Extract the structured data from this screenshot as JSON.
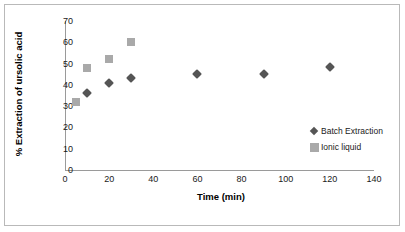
{
  "chart_data": {
    "type": "scatter",
    "title": "",
    "xlabel": "Time (min)",
    "ylabel": "% Extraction of ursolic acid",
    "xlim": [
      0,
      140
    ],
    "ylim": [
      0,
      70
    ],
    "xticks": [
      0,
      20,
      40,
      60,
      80,
      100,
      120,
      140
    ],
    "yticks": [
      0,
      10,
      20,
      30,
      40,
      50,
      60,
      70
    ],
    "grid": false,
    "legend_position": "inside-right",
    "series": [
      {
        "name": "Batch Extraction",
        "marker": "diamond",
        "color": "#555555",
        "points": [
          {
            "x": 10,
            "y": 36
          },
          {
            "x": 20,
            "y": 41
          },
          {
            "x": 30,
            "y": 43
          },
          {
            "x": 60,
            "y": 45
          },
          {
            "x": 90,
            "y": 45
          },
          {
            "x": 120,
            "y": 48.5
          }
        ]
      },
      {
        "name": "Ionic liquid",
        "marker": "square",
        "color": "#a9a9a9",
        "points": [
          {
            "x": 5,
            "y": 32
          },
          {
            "x": 10,
            "y": 48
          },
          {
            "x": 20,
            "y": 52
          },
          {
            "x": 30,
            "y": 60
          }
        ]
      }
    ]
  },
  "axes": {
    "y_tick_labels": [
      "70",
      "60",
      "50",
      "40",
      "30",
      "20",
      "10",
      "0"
    ],
    "x_tick_labels": [
      "0",
      "20",
      "40",
      "60",
      "80",
      "100",
      "120",
      "140"
    ],
    "x_title": "Time (min)",
    "y_title": "% Extraction of ursolic acid"
  },
  "legend": {
    "items": [
      {
        "label": "Batch Extraction",
        "marker": "diamond"
      },
      {
        "label": "Ionic liquid",
        "marker": "square"
      }
    ]
  }
}
